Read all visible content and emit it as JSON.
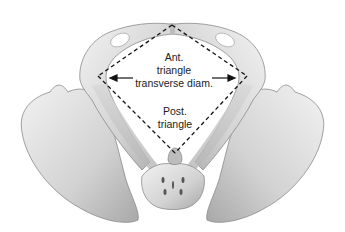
{
  "figure": {
    "labels": {
      "ant_line1": "Ant.",
      "ant_line2": "triangle",
      "transverse": "transverse diam.",
      "post_line1": "Post.",
      "post_line2": "triangle"
    },
    "diamond": {
      "top": [
        172,
        25
      ],
      "left": [
        98,
        76
      ],
      "right": [
        247,
        76
      ],
      "bottom": [
        175,
        153
      ]
    },
    "colors": {
      "bone_light": "#e6e6e6",
      "bone_mid": "#c9c9c9",
      "bone_dark": "#9a9a9a",
      "line": "#111111"
    }
  }
}
